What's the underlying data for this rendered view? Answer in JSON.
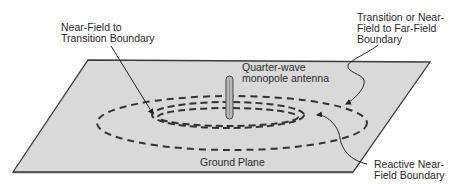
{
  "diagram": {
    "type": "antenna field regions",
    "labels": {
      "near_field_to_transition": [
        "Near-Field to",
        "Transition Boundary"
      ],
      "transition_to_far_field": [
        "Transition or Near-",
        "Field to Far-Field",
        "Boundary"
      ],
      "antenna": [
        "Quarter-wave",
        "monopole antenna"
      ],
      "ground_plane": "Ground Plane",
      "reactive_near_field": [
        "Reactive Near-",
        "Field Boundary"
      ]
    },
    "colors": {
      "ground_plane_fill": "#d9d9d9",
      "ground_plane_edge": "#3a3a3a",
      "dash": "#333333",
      "antenna_fill": "#b8b8b8",
      "text": "#2a2a2a"
    },
    "regions": [
      {
        "name": "Reactive Near-Field Boundary",
        "rx": 65,
        "ry": 11
      },
      {
        "name": "Near-Field to Transition Boundary",
        "rx": 75,
        "ry": 15
      },
      {
        "name": "Transition or Near-Field to Far-Field Boundary",
        "rx": 135,
        "ry": 28
      }
    ]
  }
}
